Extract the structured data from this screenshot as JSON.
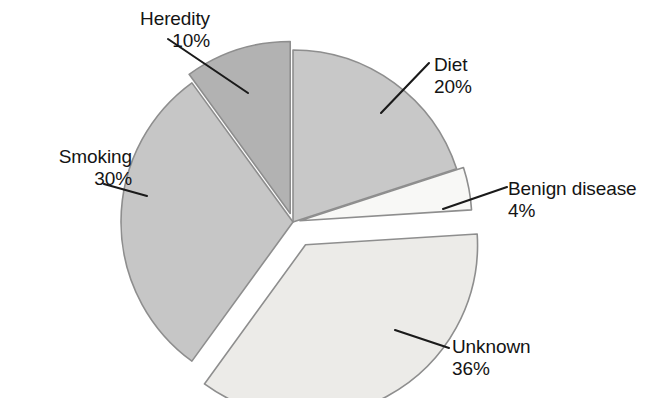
{
  "chart_data": {
    "type": "pie",
    "title": "",
    "subtitle": "",
    "xlabel": "",
    "ylabel": "",
    "grid": false,
    "legend_position": "none",
    "label_format": "name above percent",
    "total_percent": 100,
    "categories": [
      "Diet",
      "Benign disease",
      "Unknown",
      "Smoking",
      "Heredity"
    ],
    "values": [
      20,
      4,
      36,
      30,
      10
    ],
    "slices": [
      {
        "label": "Diet",
        "percent": 20,
        "percent_text": "20%",
        "color": "#c8c8c8",
        "start_angle_deg": 0,
        "end_angle_deg": 72,
        "exploded": false,
        "explode_offset_px": 0
      },
      {
        "label": "Benign disease",
        "percent": 4,
        "percent_text": "4%",
        "color": "#f8f8f6",
        "start_angle_deg": 72,
        "end_angle_deg": 86.4,
        "exploded": true,
        "explode_offset_px": 7
      },
      {
        "label": "Unknown",
        "percent": 36,
        "percent_text": "36%",
        "color": "#ecebe8",
        "start_angle_deg": 86.4,
        "end_angle_deg": 216,
        "exploded": true,
        "explode_offset_px": 26
      },
      {
        "label": "Smoking",
        "percent": 30,
        "percent_text": "30%",
        "color": "#c6c6c6",
        "start_angle_deg": 216,
        "end_angle_deg": 324,
        "exploded": false,
        "explode_offset_px": 0
      },
      {
        "label": "Heredity",
        "percent": 10,
        "percent_text": "10%",
        "color": "#b2b2b2",
        "start_angle_deg": 324,
        "end_angle_deg": 360,
        "exploded": true,
        "explode_offset_px": 9
      }
    ]
  },
  "labels": {
    "heredity": {
      "name": "Heredity",
      "percent": "10%"
    },
    "diet": {
      "name": "Diet",
      "percent": "20%"
    },
    "benign_disease": {
      "name": "Benign disease",
      "percent": "4%"
    },
    "smoking": {
      "name": "Smoking",
      "percent": "30%"
    },
    "unknown": {
      "name": "Unknown",
      "percent": "36%"
    }
  },
  "style": {
    "background_color": "#ffffff",
    "text_color": "#141414",
    "leader_line_color": "#1a1a1a",
    "slice_edge_color": "#8e8e8e"
  }
}
